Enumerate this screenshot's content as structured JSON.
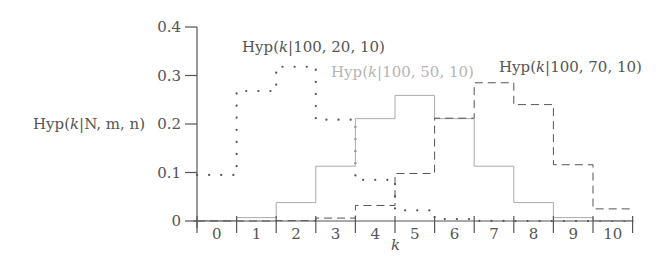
{
  "chart_data": {
    "type": "line",
    "subtype": "step",
    "title": "",
    "xlabel": "k",
    "ylabel": "Hyp(k|N, m, n)",
    "xlim": [
      0,
      10
    ],
    "ylim": [
      0,
      0.4
    ],
    "grid": false,
    "x": [
      0,
      1,
      2,
      3,
      4,
      5,
      6,
      7,
      8,
      9,
      10
    ],
    "x_tick_labels": [
      "0",
      "1",
      "2",
      "3",
      "4",
      "5",
      "6",
      "7",
      "8",
      "9",
      "10"
    ],
    "y_ticks": [
      0,
      0.1,
      0.2,
      0.3,
      0.4
    ],
    "y_tick_labels": [
      "0",
      "0.1",
      "0.2",
      "0.3",
      "0.4"
    ],
    "series": [
      {
        "name": "Hyp(k|100, 20, 10)",
        "style": "dotted",
        "color": "#555555",
        "values": [
          0.095,
          0.268,
          0.318,
          0.209,
          0.085,
          0.022,
          0.004,
          0.0004,
          0.0,
          0.0,
          0.0
        ]
      },
      {
        "name": "Hyp(k|100, 50, 10)",
        "style": "solid",
        "color": "#aaaaaa",
        "values": [
          0.0006,
          0.007,
          0.038,
          0.113,
          0.211,
          0.259,
          0.211,
          0.113,
          0.038,
          0.007,
          0.0006
        ]
      },
      {
        "name": "Hyp(k|100, 70, 10)",
        "style": "dashed",
        "color": "#555555",
        "values": [
          0.0,
          0.0,
          0.0007,
          0.006,
          0.032,
          0.098,
          0.212,
          0.285,
          0.24,
          0.116,
          0.025
        ]
      }
    ],
    "annotations": [
      {
        "text": "Hyp(k|100, 20, 10)",
        "series": 0
      },
      {
        "text": "Hyp(k|100, 50, 10)",
        "series": 1
      },
      {
        "text": "Hyp(k|100, 70, 10)",
        "series": 2
      }
    ]
  },
  "labels": {
    "ylabel_prefix": "Hyp(",
    "ylabel_k": "k",
    "ylabel_suffix": "|N, m, n)",
    "xlabel": "k",
    "series0_prefix": "Hyp(",
    "series0_k": "k",
    "series0_suffix": "|100, 20, 10)",
    "series1_prefix": "Hyp(",
    "series1_k": "k",
    "series1_suffix": "|100, 50, 10)",
    "series2_prefix": "Hyp(",
    "series2_k": "k",
    "series2_suffix": "|100, 70, 10)"
  }
}
